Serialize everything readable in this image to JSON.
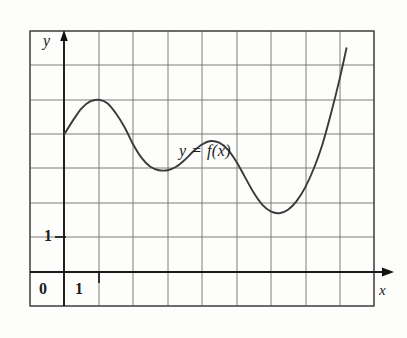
{
  "figure": {
    "kind": "cartesian-graph",
    "background_color": "#fdfdfc",
    "axis_color": "#1a1a1a",
    "grid_color": "#6e6e6e",
    "curve_color": "#3a3a3a",
    "border_color": "#5a5a5a"
  },
  "labels": {
    "y_axis": "y",
    "x_axis": "x",
    "origin": "0",
    "x_one": "1",
    "y_one": "1",
    "curve": "y = f(x)"
  },
  "chart_data": {
    "type": "line",
    "title": "",
    "subtitle": "",
    "xlabel": "x",
    "ylabel": "y",
    "annotations": [
      {
        "text": "y = f(x)",
        "x": 3.3,
        "y": 4.0
      }
    ],
    "legend": [],
    "legend_position": "none",
    "grid": true,
    "grid_spacing_x": 1,
    "grid_spacing_y": 1,
    "xlim": [
      -1,
      9
    ],
    "ylim": [
      -1,
      7
    ],
    "x_ticks": [
      0,
      1
    ],
    "x_tick_labels": [
      "0",
      "1"
    ],
    "y_ticks": [
      1
    ],
    "y_tick_labels": [
      "1"
    ],
    "axis_arrows": {
      "x": "right",
      "y": "up"
    },
    "series": [
      {
        "name": "f(x)",
        "points": [
          {
            "x": 0.0,
            "y": 4.0
          },
          {
            "x": 0.25,
            "y": 4.4
          },
          {
            "x": 0.5,
            "y": 4.75
          },
          {
            "x": 0.75,
            "y": 4.95
          },
          {
            "x": 1.0,
            "y": 5.0
          },
          {
            "x": 1.25,
            "y": 4.9
          },
          {
            "x": 1.5,
            "y": 4.6
          },
          {
            "x": 1.75,
            "y": 4.2
          },
          {
            "x": 2.0,
            "y": 3.7
          },
          {
            "x": 2.25,
            "y": 3.3
          },
          {
            "x": 2.5,
            "y": 3.05
          },
          {
            "x": 2.75,
            "y": 2.95
          },
          {
            "x": 3.0,
            "y": 2.95
          },
          {
            "x": 3.25,
            "y": 3.05
          },
          {
            "x": 3.5,
            "y": 3.25
          },
          {
            "x": 3.75,
            "y": 3.5
          },
          {
            "x": 4.0,
            "y": 3.7
          },
          {
            "x": 4.25,
            "y": 3.8
          },
          {
            "x": 4.5,
            "y": 3.75
          },
          {
            "x": 4.75,
            "y": 3.55
          },
          {
            "x": 5.0,
            "y": 3.2
          },
          {
            "x": 5.25,
            "y": 2.75
          },
          {
            "x": 5.5,
            "y": 2.3
          },
          {
            "x": 5.75,
            "y": 1.95
          },
          {
            "x": 6.0,
            "y": 1.75
          },
          {
            "x": 6.25,
            "y": 1.7
          },
          {
            "x": 6.5,
            "y": 1.8
          },
          {
            "x": 6.75,
            "y": 2.05
          },
          {
            "x": 7.0,
            "y": 2.45
          },
          {
            "x": 7.25,
            "y": 3.0
          },
          {
            "x": 7.5,
            "y": 3.7
          },
          {
            "x": 7.75,
            "y": 4.6
          },
          {
            "x": 8.0,
            "y": 5.6
          },
          {
            "x": 8.2,
            "y": 6.5
          }
        ],
        "features": {
          "start": {
            "x": 0.0,
            "y": 4.0
          },
          "local_max_1": {
            "x": 1.0,
            "y": 5.0
          },
          "local_min_1": {
            "x": 2.9,
            "y": 2.95
          },
          "local_max_2": {
            "x": 4.3,
            "y": 3.8
          },
          "local_min_2": {
            "x": 6.25,
            "y": 1.7
          },
          "end": {
            "x": 8.2,
            "y": 6.5
          }
        }
      }
    ]
  }
}
